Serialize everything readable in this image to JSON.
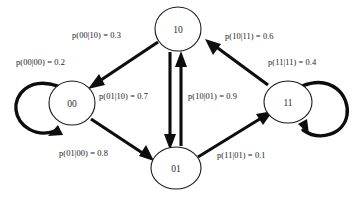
{
  "figure": {
    "type": "state-transition-diagram",
    "background_color": "#ffffff",
    "stroke_color": "#0d0d0d"
  },
  "nodes": [
    {
      "id": "10",
      "label": "10",
      "cx": 178,
      "cy": 29,
      "rx": 23,
      "ry": 22
    },
    {
      "id": "00",
      "label": "00",
      "cx": 72,
      "cy": 103,
      "rx": 23,
      "ry": 22
    },
    {
      "id": "11",
      "label": "11",
      "cx": 288,
      "cy": 102,
      "rx": 24,
      "ry": 21
    },
    {
      "id": "01",
      "label": "01",
      "cx": 176,
      "cy": 168,
      "rx": 25,
      "ry": 21
    }
  ],
  "edges": [
    {
      "id": "e-00-00",
      "from": "00",
      "to": "00",
      "kind": "self-loop",
      "label": "p(00|00) = 0.2",
      "prob": 0.2
    },
    {
      "id": "e-10-00",
      "from": "10",
      "to": "00",
      "kind": "diagonal",
      "label": "p(00|10) = 0.3",
      "prob": 0.3
    },
    {
      "id": "e-10-01",
      "from": "10",
      "to": "01",
      "kind": "vertical-down",
      "label": "p(01|10) = 0.7",
      "prob": 0.7
    },
    {
      "id": "e-01-10",
      "from": "01",
      "to": "10",
      "kind": "vertical-up",
      "label": "p(10|01) = 0.9",
      "prob": 0.9
    },
    {
      "id": "e-11-10",
      "from": "11",
      "to": "10",
      "kind": "diagonal",
      "label": "p(10|11) = 0.6",
      "prob": 0.6
    },
    {
      "id": "e-11-11",
      "from": "11",
      "to": "11",
      "kind": "self-loop",
      "label": "p(11|11) = 0.4",
      "prob": 0.4
    },
    {
      "id": "e-00-01",
      "from": "00",
      "to": "01",
      "kind": "diagonal",
      "label": "p(01|00) = 0.8",
      "prob": 0.8
    },
    {
      "id": "e-01-11",
      "from": "01",
      "to": "11",
      "kind": "diagonal",
      "label": "p(11|01) = 0.1",
      "prob": 0.1
    }
  ],
  "labels": {
    "p_00_00": {
      "text": "p(00|00) = 0.2",
      "x": 16,
      "y": 58
    },
    "p_00_10": {
      "text": "p(00|10) = 0.3",
      "x": 72,
      "y": 31
    },
    "p_01_10": {
      "text": "p(01|10) = 0.7",
      "x": 99,
      "y": 92
    },
    "p_10_01": {
      "text": "p(10|01) = 0.9",
      "x": 188,
      "y": 92
    },
    "p_10_11": {
      "text": "p(10|11) = 0.6",
      "x": 225,
      "y": 32
    },
    "p_11_11": {
      "text": "p(11|11) = 0.4",
      "x": 268,
      "y": 58
    },
    "p_01_00": {
      "text": "p(01|00) = 0.8",
      "x": 59,
      "y": 149
    },
    "p_11_01": {
      "text": "p(11|01) = 0.1",
      "x": 217,
      "y": 151
    }
  }
}
